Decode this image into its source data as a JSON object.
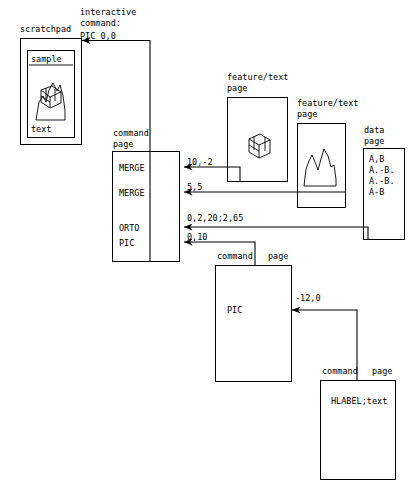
{
  "diagram": {
    "ink_color": "#000000",
    "background": "#ffffff"
  },
  "scratchpad": {
    "label": "scratchpad",
    "sample_label": "sample",
    "text_label": "text",
    "graphic": "cube-and-mountain-sketch"
  },
  "interactive": {
    "line1": "interactive",
    "line2": "command:",
    "line3": "PIC 0,0"
  },
  "main_command_page": {
    "label_line1": "command",
    "label_line2": "page",
    "rows": [
      {
        "name": "MERGE",
        "arg": "10,-2"
      },
      {
        "name": "MERGE",
        "arg": "5,5"
      },
      {
        "name": "ORTO",
        "arg": "0,2,20;2,65"
      },
      {
        "name": "PIC",
        "arg": "0,10"
      }
    ]
  },
  "feature_page_1": {
    "label_line1": "feature/text",
    "label_line2": "page",
    "graphic": "wireframe-cube"
  },
  "feature_page_2": {
    "label_line1": "feature/text",
    "label_line2": "page",
    "graphic": "mountain-profile"
  },
  "data_page": {
    "label_line1": "data",
    "label_line2": "page",
    "rows": [
      "A,B",
      "A.-B.",
      "A.-B.",
      "A-B"
    ]
  },
  "pic_command_page": {
    "label_line1": "command",
    "label_line2": "page",
    "body": "PIC",
    "arg": "-12,0"
  },
  "hlabel_command_page": {
    "label_line1": "command",
    "label_line2": "page",
    "body": "HLABEL;text"
  }
}
